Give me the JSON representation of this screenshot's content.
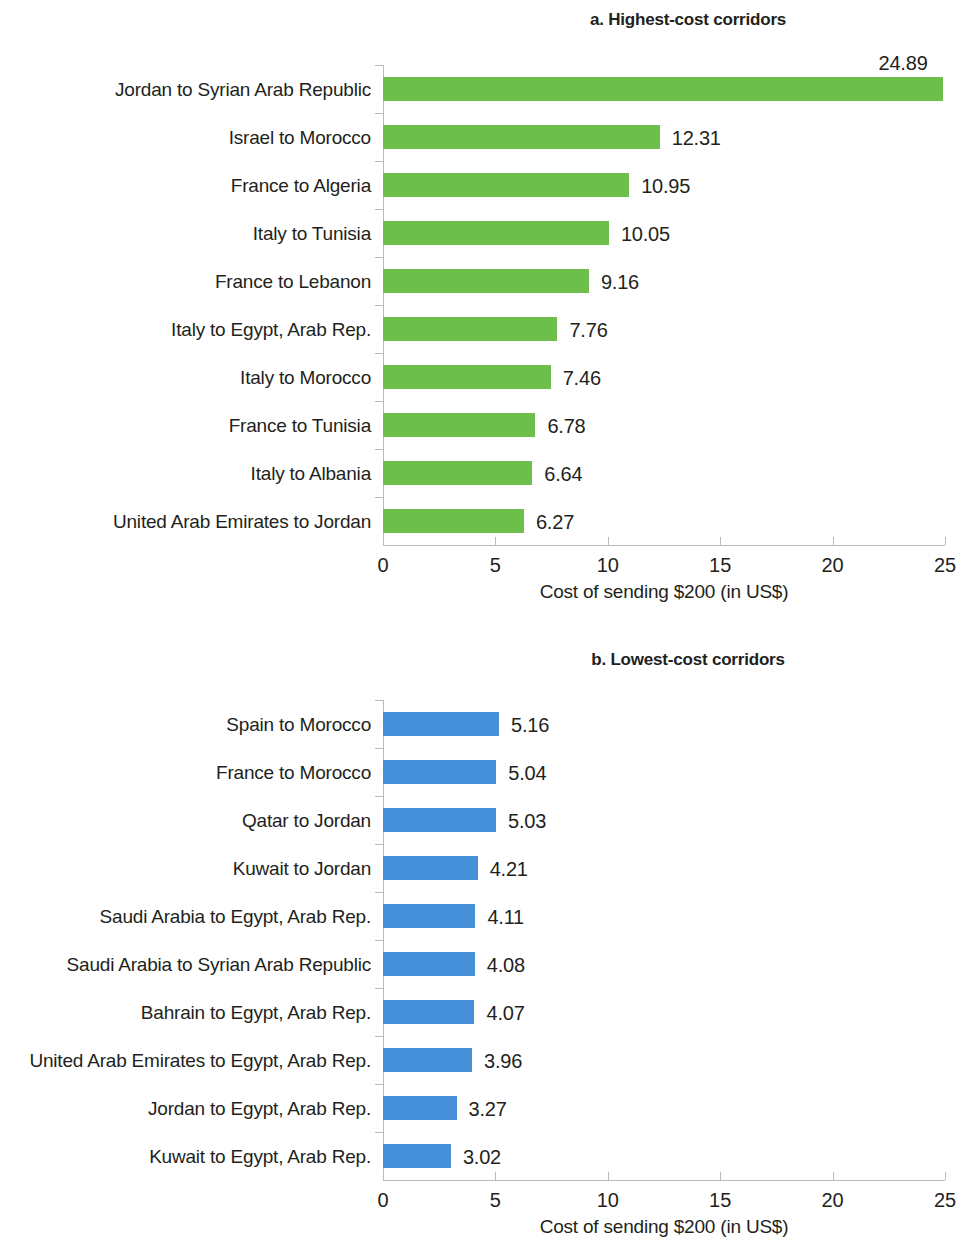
{
  "colors": {
    "green": "#6ebe4b",
    "blue": "#4590d8",
    "axis": "#b9bcbe",
    "text": "#231f20"
  },
  "panels": [
    {
      "title": "a. Highest-cost corridors",
      "axis_title": "Cost of sending $200 (in US$)",
      "tick_labels": [
        "0",
        "5",
        "10",
        "15",
        "20",
        "25"
      ]
    },
    {
      "title": "b. Lowest-cost corridors",
      "axis_title": "Cost of sending $200 (in US$)",
      "tick_labels": [
        "0",
        "5",
        "10",
        "15",
        "20",
        "25"
      ]
    }
  ],
  "chart_data": [
    {
      "type": "bar",
      "orientation": "horizontal",
      "title": "a. Highest-cost corridors",
      "xlabel": "Cost of sending $200 (in US$)",
      "ylabel": "",
      "xlim": [
        0,
        25
      ],
      "xticks": [
        0,
        5,
        10,
        15,
        20,
        25
      ],
      "grid": false,
      "legend": "none",
      "color": "#6ebe4b",
      "categories": [
        "Jordan to Syrian Arab Republic",
        "Israel to Morocco",
        "France to Algeria",
        "Italy to Tunisia",
        "France to Lebanon",
        "Italy to Egypt, Arab Rep.",
        "Italy to Morocco",
        "France to Tunisia",
        "Italy to Albania",
        "United Arab Emirates to Jordan"
      ],
      "values": [
        24.89,
        12.31,
        10.95,
        10.05,
        9.16,
        7.76,
        7.46,
        6.78,
        6.64,
        6.27
      ],
      "value_labels": [
        "24.89",
        "12.31",
        "10.95",
        "10.05",
        "9.16",
        "7.76",
        "7.46",
        "6.78",
        "6.64",
        "6.27"
      ]
    },
    {
      "type": "bar",
      "orientation": "horizontal",
      "title": "b. Lowest-cost corridors",
      "xlabel": "Cost of sending $200 (in US$)",
      "ylabel": "",
      "xlim": [
        0,
        25
      ],
      "xticks": [
        0,
        5,
        10,
        15,
        20,
        25
      ],
      "grid": false,
      "legend": "none",
      "color": "#4590d8",
      "categories": [
        "Spain to Morocco",
        "France to Morocco",
        "Qatar to Jordan",
        "Kuwait to Jordan",
        "Saudi Arabia to Egypt, Arab Rep.",
        "Saudi Arabia to Syrian Arab Republic",
        "Bahrain to Egypt, Arab Rep.",
        "United Arab Emirates to Egypt, Arab Rep.",
        "Jordan to Egypt, Arab Rep.",
        "Kuwait to Egypt, Arab Rep."
      ],
      "values": [
        5.16,
        5.04,
        5.03,
        4.21,
        4.11,
        4.08,
        4.07,
        3.96,
        3.27,
        3.02
      ],
      "value_labels": [
        "5.16",
        "5.04",
        "5.03",
        "4.21",
        "4.11",
        "4.08",
        "4.07",
        "3.96",
        "3.27",
        "3.02"
      ]
    }
  ]
}
